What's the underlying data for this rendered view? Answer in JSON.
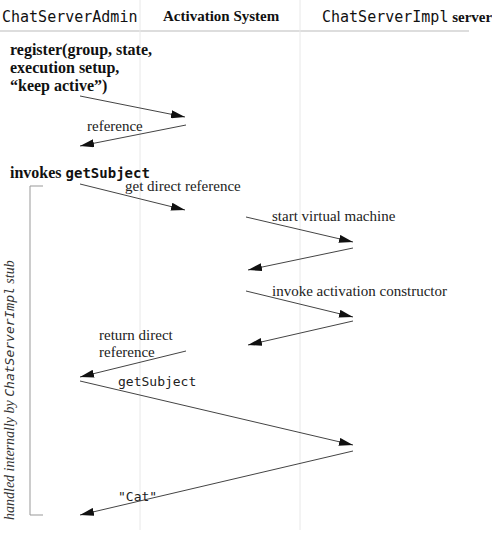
{
  "header": {
    "col1": "ChatServerAdmin",
    "col2": "Activation System",
    "col3_mono": "ChatServerImpl",
    "col3_rest": " server"
  },
  "steps": {
    "register_lines": [
      "register(group, state,",
      "execution setup,",
      "“keep active”)"
    ],
    "invokes_prefix": "invokes ",
    "invokes_method": "getSubject"
  },
  "messages": [
    {
      "label": "",
      "from": [
        80,
        96
      ],
      "to": [
        185,
        117
      ]
    },
    {
      "label": "reference",
      "from": [
        186,
        125
      ],
      "to": [
        80,
        146
      ]
    },
    {
      "label": "get direct reference",
      "from": [
        80,
        184
      ],
      "to": [
        185,
        210
      ]
    },
    {
      "label": "start virtual machine",
      "from": [
        246,
        217
      ],
      "to": [
        353,
        242
      ]
    },
    {
      "label": "",
      "from": [
        353,
        248
      ],
      "to": [
        248,
        270
      ]
    },
    {
      "label": "invoke activation constructor",
      "from": [
        246,
        291
      ],
      "to": [
        353,
        317
      ]
    },
    {
      "label": "",
      "from": [
        353,
        321
      ],
      "to": [
        248,
        345
      ]
    },
    {
      "label": "return direct reference",
      "from": [
        186,
        351
      ],
      "to": [
        80,
        377
      ]
    },
    {
      "label": "getSubject",
      "from": [
        80,
        381
      ],
      "to": [
        353,
        445
      ]
    },
    {
      "label": "\"Cat\"",
      "from": [
        353,
        451
      ],
      "to": [
        80,
        515
      ]
    }
  ],
  "labels": {
    "reference": "reference",
    "get_direct_reference": "get direct reference",
    "start_vm": "start virtual machine",
    "invoke_ctor": "invoke activation constructor",
    "return_direct_1": "return direct",
    "return_direct_2": "reference",
    "get_subject": "getSubject",
    "cat": "\"Cat\""
  },
  "bracket_note": {
    "prefix": "handled internally by ",
    "mono": "ChatServerImpl",
    "suffix": " stub"
  },
  "colors": {
    "line": "#444444",
    "lifeline": "#e6e6e6",
    "header_rule": "#bbbbbb",
    "bracket": "#999999"
  }
}
